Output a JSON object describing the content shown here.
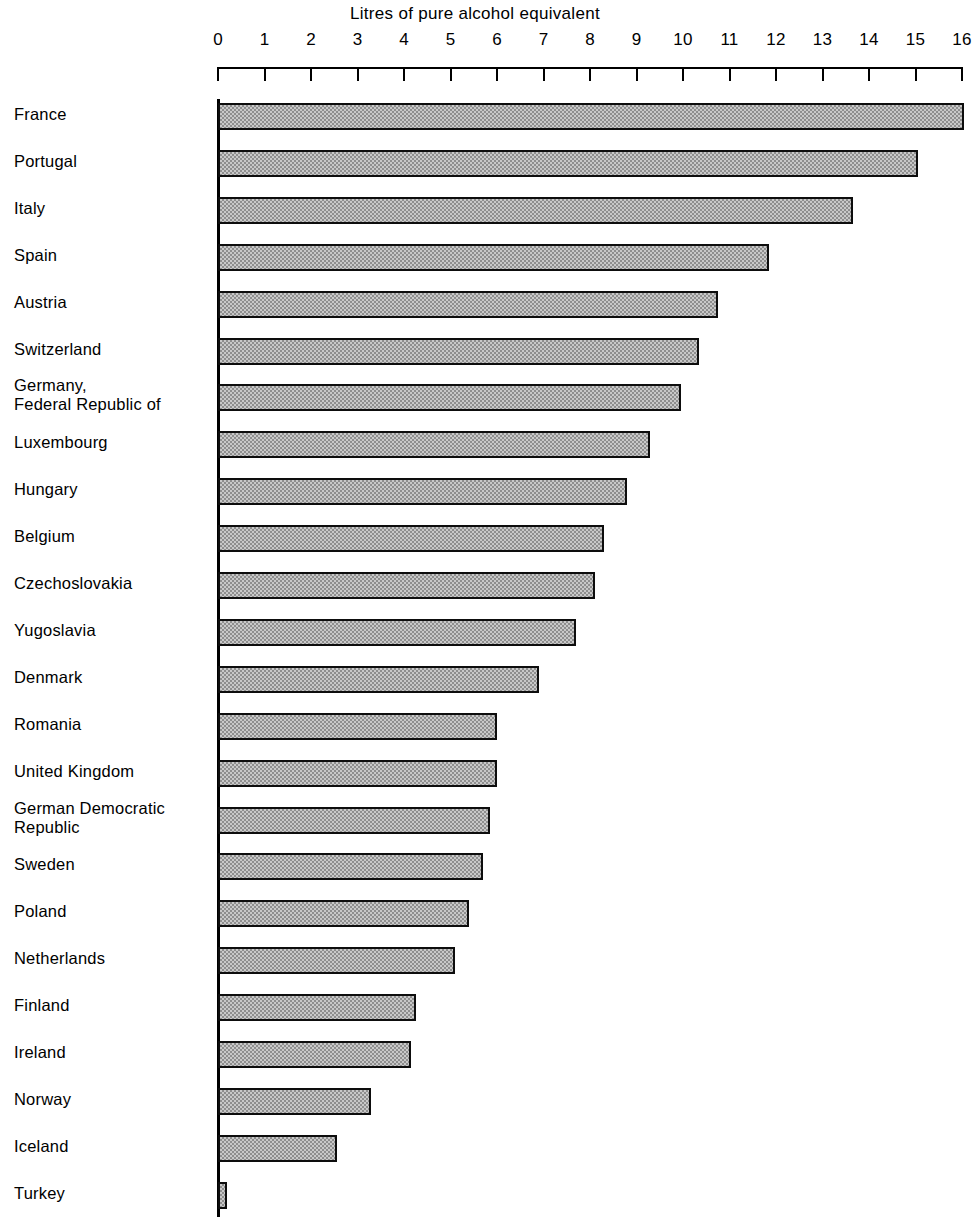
{
  "chart_data": {
    "type": "bar",
    "orientation": "horizontal",
    "title": "Litres of pure alcohol equivalent",
    "xlabel": "Litres of pure alcohol equivalent",
    "ylabel": "",
    "xlim": [
      0,
      16
    ],
    "xticks": [
      0,
      1,
      2,
      3,
      4,
      5,
      6,
      7,
      8,
      9,
      10,
      11,
      12,
      13,
      14,
      15,
      16
    ],
    "xtick_labels": [
      "0",
      "1",
      "2",
      "3",
      "4",
      "5",
      "6",
      "7",
      "8",
      "9",
      "10",
      "11",
      "12",
      "13",
      "14",
      "15",
      "16"
    ],
    "grid": false,
    "legend": null,
    "categories": [
      "France",
      "Portugal",
      "Italy",
      "Spain",
      "Austria",
      "Switzerland",
      "Germany,\nFederal Republic of",
      "Luxembourg",
      "Hungary",
      "Belgium",
      "Czechoslovakia",
      "Yugoslavia",
      "Denmark",
      "Romania",
      "United Kingdom",
      "German Democratic\nRepublic",
      "Sweden",
      "Poland",
      "Netherlands",
      "Finland",
      "Ireland",
      "Norway",
      "Iceland",
      "Turkey"
    ],
    "values": [
      16.05,
      15.05,
      13.65,
      11.85,
      10.75,
      10.35,
      9.95,
      9.3,
      8.8,
      8.3,
      8.1,
      7.7,
      6.9,
      6.0,
      6.0,
      5.85,
      5.7,
      5.4,
      5.1,
      4.25,
      4.15,
      3.3,
      2.55,
      0.2
    ],
    "bar_fill": "#c8c8c8",
    "bar_pattern": "checkerboard-dither",
    "bar_border": "#0d0d0d"
  },
  "colors": {
    "background": "#ffffff",
    "ink": "#000000",
    "bar_fill": "#c8c8c8",
    "bar_pattern_dark": "#8e8e8e",
    "bar_border": "#0d0d0d"
  }
}
